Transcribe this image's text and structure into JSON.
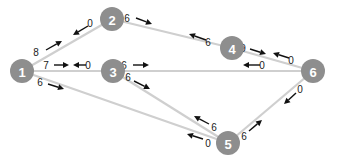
{
  "diagram": {
    "type": "flow-network",
    "colors": {
      "node": "#8e8e8e",
      "node_text": "#ffffff",
      "edge": "#cfcfcf",
      "label": "#222222",
      "arrow": "#111111"
    },
    "nodes": [
      {
        "id": "1",
        "label": "1",
        "x": 22,
        "y": 71
      },
      {
        "id": "2",
        "label": "2",
        "x": 112,
        "y": 19
      },
      {
        "id": "3",
        "label": "3",
        "x": 113,
        "y": 71
      },
      {
        "id": "4",
        "label": "4",
        "x": 232,
        "y": 48
      },
      {
        "id": "5",
        "label": "5",
        "x": 228,
        "y": 143
      },
      {
        "id": "6",
        "label": "6",
        "x": 313,
        "y": 71
      }
    ],
    "edges": [
      {
        "from": "1",
        "to": "2"
      },
      {
        "from": "2",
        "to": "4"
      },
      {
        "from": "1",
        "to": "3"
      },
      {
        "from": "3",
        "to": "6"
      },
      {
        "from": "4",
        "to": "6"
      },
      {
        "from": "1",
        "to": "5"
      },
      {
        "from": "3",
        "to": "5"
      },
      {
        "from": "5",
        "to": "6"
      }
    ],
    "flow_labels": [
      {
        "edge": "1-2",
        "value": "8",
        "direction": "toward 2",
        "lx": 36,
        "ly": 52,
        "ax1": 46,
        "ay1": 50,
        "ax2": 62,
        "ay2": 41
      },
      {
        "edge": "1-2",
        "value": "0",
        "direction": "toward 1",
        "lx": 90,
        "ly": 23,
        "ax1": 88,
        "ay1": 26,
        "ax2": 73,
        "ay2": 35
      },
      {
        "edge": "2-4",
        "value": "6",
        "direction": "toward 4",
        "lx": 127,
        "ly": 18,
        "ax1": 136,
        "ay1": 18,
        "ax2": 152,
        "ay2": 24
      },
      {
        "edge": "2-4",
        "value": "6",
        "direction": "toward 2",
        "lx": 208,
        "ly": 42,
        "ax1": 206,
        "ay1": 40,
        "ax2": 189,
        "ay2": 34
      },
      {
        "edge": "1-3",
        "value": "7",
        "direction": "toward 3",
        "lx": 46,
        "ly": 65,
        "ax1": 54,
        "ay1": 65,
        "ax2": 69,
        "ay2": 65
      },
      {
        "edge": "1-3",
        "value": "0",
        "direction": "toward 1",
        "lx": 88,
        "ly": 65,
        "ax1": 86,
        "ay1": 65,
        "ax2": 73,
        "ay2": 65
      },
      {
        "edge": "3-6",
        "value": "6",
        "direction": "toward 6",
        "lx": 124,
        "ly": 65,
        "ax1": 133,
        "ay1": 65,
        "ax2": 149,
        "ay2": 65
      },
      {
        "edge": "3-6",
        "value": "0",
        "direction": "toward 3",
        "lx": 262,
        "ly": 65,
        "ax1": 260,
        "ay1": 65,
        "ax2": 243,
        "ay2": 65
      },
      {
        "edge": "4-6",
        "value": "9",
        "direction": "toward 6",
        "lx": 243,
        "ly": 48,
        "ax1": 250,
        "ay1": 49,
        "ax2": 266,
        "ay2": 54
      },
      {
        "edge": "4-6",
        "value": "0",
        "direction": "toward 4",
        "lx": 291,
        "ly": 60,
        "ax1": 289,
        "ay1": 58,
        "ax2": 273,
        "ay2": 53
      },
      {
        "edge": "1-5",
        "value": "6",
        "direction": "toward 5",
        "lx": 40,
        "ly": 82,
        "ax1": 48,
        "ay1": 84,
        "ax2": 64,
        "ay2": 89
      },
      {
        "edge": "1-5",
        "value": "0",
        "direction": "toward 1",
        "lx": 208,
        "ly": 143,
        "ax1": 203,
        "ay1": 139,
        "ax2": 187,
        "ay2": 134
      },
      {
        "edge": "3-5",
        "value": "6",
        "direction": "toward 5",
        "lx": 128,
        "ly": 77,
        "ax1": 134,
        "ay1": 81,
        "ax2": 150,
        "ay2": 89
      },
      {
        "edge": "3-5",
        "value": "6",
        "direction": "toward 3",
        "lx": 214,
        "ly": 127,
        "ax1": 209,
        "ay1": 124,
        "ax2": 194,
        "ay2": 116
      },
      {
        "edge": "5-6",
        "value": "6",
        "direction": "toward 6",
        "lx": 244,
        "ly": 136,
        "ax1": 249,
        "ay1": 131,
        "ax2": 262,
        "ay2": 120
      },
      {
        "edge": "5-6",
        "value": "0",
        "direction": "toward 5",
        "lx": 300,
        "ly": 89,
        "ax1": 296,
        "ay1": 93,
        "ax2": 284,
        "ay2": 104
      }
    ]
  }
}
